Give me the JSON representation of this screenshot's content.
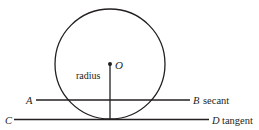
{
  "diagram": {
    "colors": {
      "stroke": "#231f20",
      "background": "#ffffff"
    },
    "circle": {
      "cx": 110,
      "cy": 64,
      "r": 55
    },
    "center": {
      "label": "O"
    },
    "radius": {
      "label": "radius"
    },
    "secant": {
      "start_label": "A",
      "end_label": "B",
      "name": "secant"
    },
    "tangent": {
      "start_label": "C",
      "end_label": "D",
      "name": "tangent"
    }
  }
}
